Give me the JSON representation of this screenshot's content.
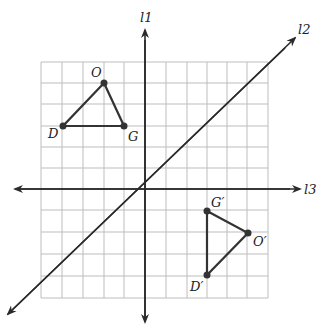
{
  "diagram": {
    "type": "coordinate-grid-reflection",
    "lines": {
      "l1": "l1",
      "l2": "l2",
      "l3": "l3"
    },
    "triangle": {
      "O": "O",
      "D": "D",
      "G": "G"
    },
    "image_triangle": {
      "G_prime": "G′",
      "O_prime": "O′",
      "D_prime": "D′"
    },
    "colors": {
      "grid": "#bdbdbd",
      "axis": "#2a2a2a",
      "triangle": "#333333"
    }
  }
}
